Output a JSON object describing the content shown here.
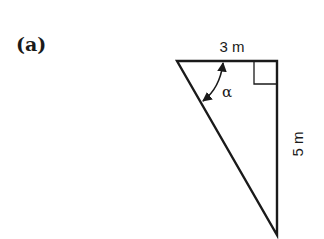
{
  "figure": {
    "panel_label": "(a)",
    "top_side_label": "3 m",
    "right_side_label": "5 m",
    "angle_label": "α",
    "right_angle_marker": true,
    "stroke_color": "#1a1a1a",
    "background": "#ffffff"
  }
}
